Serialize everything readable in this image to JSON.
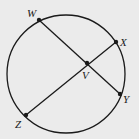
{
  "diagram": {
    "type": "circle-with-intersecting-chords",
    "stroke_color": "#1a1a1a",
    "background_color": "#ebebeb",
    "points": [
      {
        "id": "W",
        "label": "W",
        "on_circle": true
      },
      {
        "id": "X",
        "label": "X",
        "on_circle": true
      },
      {
        "id": "Y",
        "label": "Y",
        "on_circle": true
      },
      {
        "id": "Z",
        "label": "Z",
        "on_circle": true
      },
      {
        "id": "V",
        "label": "V",
        "on_circle": false,
        "intersection_of": [
          "WY",
          "ZX"
        ]
      }
    ],
    "chords": [
      {
        "id": "WY",
        "from": "W",
        "to": "Y"
      },
      {
        "id": "ZX",
        "from": "Z",
        "to": "X"
      }
    ]
  }
}
